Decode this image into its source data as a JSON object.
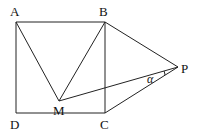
{
  "diagram": {
    "points": {
      "A": {
        "label": "A",
        "x": 16,
        "y": 22,
        "lx": 10,
        "ly": 16
      },
      "B": {
        "label": "B",
        "x": 105,
        "y": 22,
        "lx": 99,
        "ly": 16
      },
      "C": {
        "label": "C",
        "x": 105,
        "y": 113,
        "lx": 100,
        "ly": 129
      },
      "D": {
        "label": "D",
        "x": 16,
        "y": 113,
        "lx": 10,
        "ly": 129
      },
      "M": {
        "label": "M",
        "x": 59,
        "y": 101,
        "lx": 53,
        "ly": 115
      },
      "P": {
        "label": "P",
        "x": 178,
        "y": 67,
        "lx": 181,
        "ly": 73
      }
    },
    "segments": [
      [
        "A",
        "B"
      ],
      [
        "B",
        "C"
      ],
      [
        "C",
        "D"
      ],
      [
        "D",
        "A"
      ],
      [
        "A",
        "M"
      ],
      [
        "B",
        "M"
      ],
      [
        "M",
        "P"
      ],
      [
        "B",
        "P"
      ],
      [
        "C",
        "P"
      ]
    ],
    "angle": {
      "label": "α",
      "vertex": "P",
      "between": [
        "M",
        "C"
      ],
      "lx": 147,
      "ly": 83
    }
  }
}
